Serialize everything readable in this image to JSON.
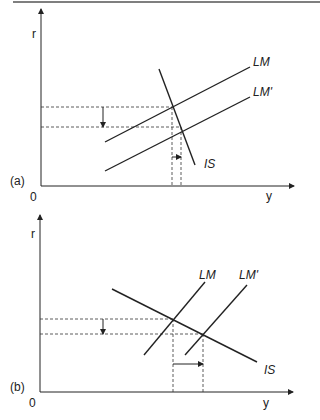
{
  "figure": {
    "panels": [
      {
        "id": "a",
        "panel_label": "(a)",
        "y_axis_label": "r",
        "x_axis_label": "y",
        "origin_label": "0",
        "curves": {
          "lm": "LM",
          "lm_prime": "LM'",
          "is": "IS"
        },
        "description": "Steep IS curve: LM shifts right to LM', interest rate falls a lot, output rises a little"
      },
      {
        "id": "b",
        "panel_label": "(b)",
        "y_axis_label": "r",
        "x_axis_label": "y",
        "origin_label": "0",
        "curves": {
          "lm": "LM",
          "lm_prime": "LM'",
          "is": "IS"
        },
        "description": "Flat IS curve: LM shifts right to LM', interest rate falls a little, output rises a lot"
      }
    ],
    "colors": {
      "line": "#222222",
      "rule": "#555555",
      "background": "#ffffff"
    }
  }
}
